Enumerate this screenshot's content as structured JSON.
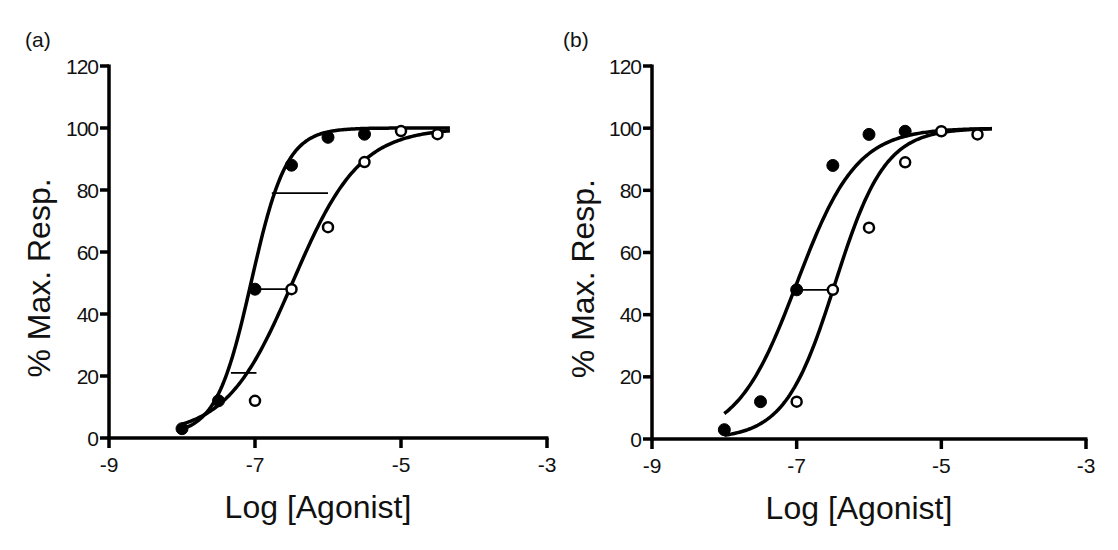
{
  "chart_data": [
    {
      "type": "scatter",
      "panel_label": "(a)",
      "title": "",
      "xlabel": "Log [Agonist]",
      "ylabel": "% Max. Resp.",
      "xlim": [
        -9,
        -3
      ],
      "ylim": [
        0,
        120
      ],
      "xticks": [
        -9,
        -7,
        -5,
        -3
      ],
      "yticks": [
        0,
        20,
        40,
        60,
        80,
        100,
        120
      ],
      "grid": false,
      "legend": null,
      "series": [
        {
          "name": "control (filled circles)",
          "marker": "filled-circle",
          "x": [
            -8,
            -7.5,
            -7,
            -6.5,
            -6,
            -5.5
          ],
          "y": [
            3,
            12,
            48,
            88,
            97,
            98
          ],
          "fit": {
            "model": "hill",
            "bottom": 1,
            "top": 100,
            "logEC50": -7.05,
            "hill": 1.8,
            "xrange": [
              -8,
              -4.33
            ]
          }
        },
        {
          "name": "treated (open circles)",
          "marker": "open-circle",
          "x": [
            -7,
            -6.5,
            -6,
            -5.5,
            -5,
            -4.5
          ],
          "y": [
            12,
            48,
            68,
            89,
            99,
            98
          ],
          "fit": {
            "model": "hill",
            "bottom": 1,
            "top": 100,
            "logEC50": -6.48,
            "hill": 0.95,
            "xrange": [
              -8,
              -4.33
            ]
          }
        }
      ],
      "annotations": [
        {
          "type": "hline",
          "y": 48,
          "x1": -7,
          "x2": -6.5,
          "label": "dose ratio at 50%"
        },
        {
          "type": "hline",
          "y": 79,
          "x1": -6.77,
          "x2": -6.0,
          "label": "dose ratio at ~80%"
        },
        {
          "type": "hline",
          "y": 21,
          "x1": -7.33,
          "x2": -6.98,
          "label": "dose ratio at ~20%"
        }
      ]
    },
    {
      "type": "scatter",
      "panel_label": "(b)",
      "title": "",
      "xlabel": "Log [Agonist]",
      "ylabel": "% Max. Resp.",
      "xlim": [
        -9,
        -3
      ],
      "ylim": [
        0,
        120
      ],
      "xticks": [
        -9,
        -7,
        -5,
        -3
      ],
      "yticks": [
        0,
        20,
        40,
        60,
        80,
        100,
        120
      ],
      "grid": false,
      "legend": null,
      "series": [
        {
          "name": "control (filled circles)",
          "marker": "filled-circle",
          "x": [
            -8,
            -7.5,
            -7,
            -6.5,
            -6,
            -5.5
          ],
          "y": [
            3,
            12,
            48,
            88,
            98,
            99
          ],
          "fit": {
            "model": "hill",
            "bottom": 0,
            "top": 100,
            "logEC50": -7.0,
            "hill": 1.05,
            "xrange": [
              -8,
              -4.3
            ]
          }
        },
        {
          "name": "treated (open circles)",
          "marker": "open-circle",
          "x": [
            -7,
            -6.5,
            -6,
            -5.5,
            -5,
            -4.5
          ],
          "y": [
            12,
            48,
            68,
            89,
            99,
            98
          ],
          "fit": {
            "model": "hill",
            "bottom": 0,
            "top": 100,
            "logEC50": -6.47,
            "hill": 1.25,
            "xrange": [
              -8,
              -4.3
            ]
          }
        }
      ],
      "annotations": [
        {
          "type": "hline",
          "y": 48,
          "x1": -7,
          "x2": -6.5,
          "label": "dose ratio at 50%"
        }
      ]
    }
  ],
  "layout": {
    "panels": [
      {
        "id": "a",
        "x0_px": 109,
        "x1_px": 547,
        "y0_px": 438,
        "ytop_px": 66,
        "label_pos": [
          25,
          47
        ],
        "ylabel_x": 50
      },
      {
        "id": "b",
        "x0_px": 93,
        "x1_px": 527,
        "y0_px": 439,
        "ytop_px": 66,
        "label_pos": [
          4,
          47
        ],
        "ylabel_x": 35
      }
    ]
  }
}
